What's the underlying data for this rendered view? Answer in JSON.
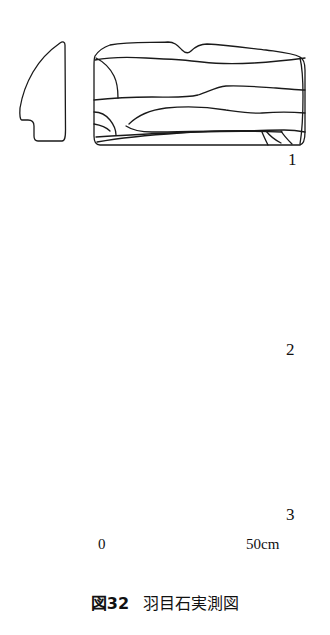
{
  "figure": {
    "caption_number": "図32",
    "caption_title": "羽目石実測図",
    "caption_full": "図32　羽目石実測図",
    "background_color": "#ffffff",
    "line_color": "#1a1a1a"
  },
  "scale_bar": {
    "start_label": "0",
    "end_label": "50cm",
    "units": "cm",
    "min": 0,
    "max": 50,
    "segments": 10,
    "segment_value": 5,
    "pixel_start_x": 103,
    "pixel_end_x": 272,
    "pixel_y": 566
  },
  "stones": [
    {
      "number": "1",
      "label": "1",
      "profile_view": "side-section",
      "elevation_view": "front-elevation",
      "shape": "wedge-tapering-with-basal-notch",
      "elevation_shape": "wide-rectangular-block-with-notched-top"
    },
    {
      "number": "2",
      "label": "2",
      "profile_view": "side-section",
      "elevation_view": "front-elevation",
      "shape": "tall-tapering-slab",
      "elevation_shape": "rounded-rectangular-block"
    },
    {
      "number": "3",
      "label": "3",
      "profile_view": "side-section",
      "elevation_view": "front-elevation",
      "shape": "tapering-slab-with-basal-notch",
      "elevation_shape": "L-shaped-block-with-raised-right-step"
    }
  ]
}
